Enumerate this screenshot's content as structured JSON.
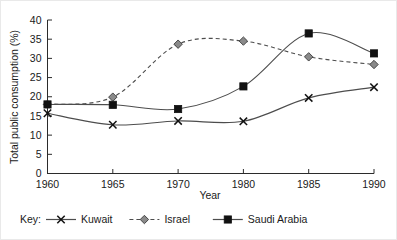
{
  "chart_data": {
    "type": "line",
    "title": "",
    "xlabel": "Year",
    "ylabel": "Total public consumption (%)",
    "categories": [
      "1960",
      "1965",
      "1970",
      "1980",
      "1985",
      "1990"
    ],
    "x": [
      1960,
      1965,
      1970,
      1980,
      1985,
      1990
    ],
    "xlim": [
      0,
      5
    ],
    "ylim": [
      0,
      40
    ],
    "yticks": [
      "0",
      "5",
      "10",
      "15",
      "20",
      "25",
      "30",
      "35",
      "40"
    ],
    "ytick_values": [
      0,
      5,
      10,
      15,
      20,
      25,
      30,
      35,
      40
    ],
    "grid": false,
    "legend_position": "below",
    "legend_prefix": "Key:",
    "series": [
      {
        "name": "Kuwait",
        "marker": "cross",
        "linestyle": "solid",
        "color": "#111111",
        "values": [
          15.7,
          12.7,
          13.7,
          13.6,
          19.7,
          22.5
        ]
      },
      {
        "name": "Israel",
        "marker": "diamond",
        "linestyle": "dashed",
        "color": "#8a8a8a",
        "values": [
          18.0,
          19.9,
          33.7,
          34.5,
          30.4,
          28.4
        ]
      },
      {
        "name": "Saudi Arabia",
        "marker": "square",
        "linestyle": "solid",
        "color": "#111111",
        "values": [
          18.0,
          17.9,
          16.8,
          22.7,
          36.5,
          31.3
        ]
      }
    ]
  },
  "axes": {
    "y_title": "Total public consumption (%)",
    "x_title": "Year"
  },
  "legend": {
    "prefix": "Key:",
    "entries": [
      {
        "label": "Kuwait",
        "marker": "cross-marker",
        "line": "solid"
      },
      {
        "label": "Israel",
        "marker": "diamond-marker",
        "line": "dashed"
      },
      {
        "label": "Saudi Arabia",
        "marker": "square-marker",
        "line": "solid"
      }
    ]
  },
  "colors": {
    "axis": "#2b2b2b",
    "line": "#4d4d4d",
    "square_marker": "#111111",
    "diamond_marker": "#8a8a8a",
    "cross_marker": "#111111",
    "background": "#ffffff"
  }
}
